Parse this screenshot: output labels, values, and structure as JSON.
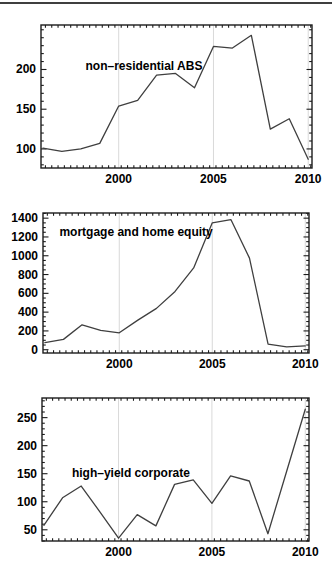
{
  "figure": {
    "background": "#ffffff",
    "top_rule_color": "#3f3f3f",
    "axis_color": "#1c1c1c",
    "label_color": "#000000"
  },
  "chart_data": [
    {
      "type": "line",
      "title": "non–residential ABS",
      "x": [
        1996,
        1997,
        1998,
        1999,
        2000,
        2001,
        2002,
        2003,
        2004,
        2005,
        2006,
        2007,
        2008,
        2009,
        2010
      ],
      "values": [
        101,
        97,
        100,
        107,
        154,
        161,
        193,
        195,
        177,
        229,
        227,
        243,
        125,
        138,
        87
      ],
      "xlim": [
        1995.9,
        2010.2
      ],
      "ylim": [
        76,
        256
      ],
      "xticks": [
        2000,
        2005,
        2010
      ],
      "xtick_labels": [
        "2000",
        "2005",
        "2010"
      ],
      "x_minor_step": 0.3333,
      "yticks": [
        100,
        150,
        200
      ],
      "ytick_labels": [
        "100",
        "150",
        "200"
      ],
      "y_minor_step": 10,
      "gridlines_x": [
        2000,
        2005,
        2010
      ],
      "grid_on": true,
      "grid_color": "#d9d9d9",
      "line_color": "#3f3f3f",
      "title_frac_pos": [
        0.38,
        0.287
      ],
      "frame_px": {
        "left": 41,
        "top": 25,
        "right": 312,
        "bottom": 168
      }
    },
    {
      "type": "line",
      "title": "mortgage and home equity",
      "x": [
        1996,
        1997,
        1998,
        1999,
        2000,
        2001,
        2002,
        2003,
        2004,
        2005,
        2006,
        2007,
        2008,
        2009,
        2010
      ],
      "values": [
        75,
        110,
        265,
        205,
        180,
        315,
        440,
        620,
        870,
        1350,
        1385,
        975,
        60,
        30,
        40
      ],
      "xlim": [
        1995.9,
        2010.2
      ],
      "ylim": [
        -35,
        1455
      ],
      "xticks": [
        2000,
        2005,
        2010
      ],
      "xtick_labels": [
        "2000",
        "2005",
        "2010"
      ],
      "x_minor_step": 0.3333,
      "yticks": [
        0,
        200,
        400,
        600,
        800,
        1000,
        1200,
        1400
      ],
      "ytick_labels": [
        "0",
        "200",
        "400",
        "600",
        "800",
        "1000",
        "1200",
        "1400"
      ],
      "y_minor_step": 50,
      "gridlines_x": [
        2000,
        2005,
        2010
      ],
      "grid_on": true,
      "grid_color": "#d9d9d9",
      "line_color": "#3f3f3f",
      "title_frac_pos": [
        0.35,
        0.136
      ],
      "frame_px": {
        "left": 43,
        "top": 213,
        "right": 309,
        "bottom": 353
      }
    },
    {
      "type": "line",
      "title": "high–yield corporate",
      "x": [
        1996,
        1997,
        1998,
        1999,
        2000,
        2001,
        2002,
        2003,
        2004,
        2005,
        2006,
        2007,
        2008,
        2009,
        2010
      ],
      "values": [
        58,
        107,
        128,
        82,
        35,
        77,
        57,
        131,
        139,
        97,
        146,
        137,
        43,
        154,
        265
      ],
      "xlim": [
        1995.9,
        2010.2
      ],
      "ylim": [
        30,
        285
      ],
      "xticks": [
        2000,
        2005,
        2010
      ],
      "xtick_labels": [
        "2000",
        "2005",
        "2010"
      ],
      "x_minor_step": 0.3333,
      "yticks": [
        50,
        100,
        150,
        200,
        250
      ],
      "ytick_labels": [
        "50",
        "100",
        "150",
        "200",
        "250"
      ],
      "y_minor_step": 10,
      "gridlines_x": [
        2000,
        2005,
        2010
      ],
      "grid_on": true,
      "grid_color": "#d9d9d9",
      "line_color": "#3f3f3f",
      "title_frac_pos": [
        0.333,
        0.524
      ],
      "frame_px": {
        "left": 42,
        "top": 398,
        "right": 309,
        "bottom": 541
      }
    }
  ]
}
